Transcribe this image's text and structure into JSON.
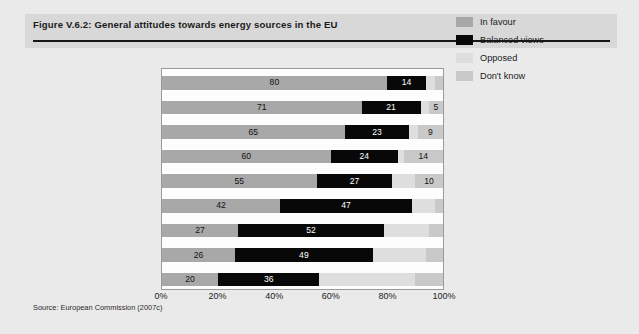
{
  "figure": {
    "title": "Figure V.6.2: General attitudes towards energy sources in the EU",
    "source": "Source: European Commission (2007c)"
  },
  "legend": {
    "position": "right",
    "items": [
      {
        "label": "In favour",
        "color": "#a8a8a8"
      },
      {
        "label": "Balanced views",
        "color": "#080808"
      },
      {
        "label": "Opposed",
        "color": "#dedede"
      },
      {
        "label": "Don't know",
        "color": "#c9c9c9"
      }
    ]
  },
  "axis": {
    "ticks": [
      "0%",
      "20%",
      "40%",
      "60%",
      "80%",
      "100%"
    ],
    "tick_values": [
      0,
      20,
      40,
      60,
      80,
      100
    ]
  },
  "chart_data": {
    "type": "bar",
    "orientation": "horizontal",
    "stacked": true,
    "title": "Figure V.6.2: General attitudes towards energy sources in the EU",
    "xlabel": "",
    "ylabel": "",
    "xlim": [
      0,
      100
    ],
    "grid": false,
    "legend_position": "right",
    "categories": [
      "Solar energy",
      "Wind energy",
      "Hydroelectric energy",
      "Ocean energy",
      "Biomass energy",
      "Gas",
      "Oil",
      "Coal",
      "Nuclear energy"
    ],
    "series": [
      {
        "name": "In favour",
        "color": "#a8a8a8",
        "values": [
          80,
          71,
          65,
          60,
          55,
          42,
          27,
          26,
          20
        ]
      },
      {
        "name": "Balanced views",
        "color": "#080808",
        "values": [
          14,
          21,
          23,
          24,
          27,
          47,
          52,
          49,
          36
        ]
      },
      {
        "name": "Opposed",
        "color": "#dedede",
        "values": [
          3,
          3,
          3,
          2,
          8,
          8,
          16,
          19,
          34
        ]
      },
      {
        "name": "Don't know",
        "color": "#c9c9c9",
        "values": [
          3,
          5,
          9,
          14,
          10,
          3,
          5,
          6,
          10
        ]
      }
    ],
    "labeled_values": [
      {
        "category": "Solar energy",
        "favour": "80",
        "balanced": "14",
        "opposed": "",
        "dont_know": ""
      },
      {
        "category": "Wind energy",
        "favour": "71",
        "balanced": "21",
        "opposed": "",
        "dont_know": "5"
      },
      {
        "category": "Hydroelectric energy",
        "favour": "65",
        "balanced": "23",
        "opposed": "",
        "dont_know": "9"
      },
      {
        "category": "Ocean energy",
        "favour": "60",
        "balanced": "24",
        "opposed": "",
        "dont_know": "14"
      },
      {
        "category": "Biomass energy",
        "favour": "55",
        "balanced": "27",
        "opposed": "",
        "dont_know": "10"
      },
      {
        "category": "Gas",
        "favour": "42",
        "balanced": "47",
        "opposed": "",
        "dont_know": ""
      },
      {
        "category": "Oil",
        "favour": "27",
        "balanced": "52",
        "opposed": "",
        "dont_know": ""
      },
      {
        "category": "Coal",
        "favour": "26",
        "balanced": "49",
        "opposed": "",
        "dont_know": ""
      },
      {
        "category": "Nuclear energy",
        "favour": "20",
        "balanced": "36",
        "opposed": "",
        "dont_know": ""
      }
    ]
  }
}
